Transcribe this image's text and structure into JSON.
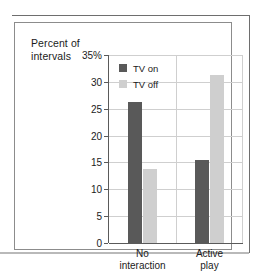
{
  "chart_data": {
    "type": "bar",
    "title": "",
    "subtitle": "",
    "ylabel": "Percent of intervals",
    "xlabel": "",
    "categories": [
      "No interaction",
      "Active play"
    ],
    "category_lines": [
      [
        "No",
        "interaction"
      ],
      [
        "Active",
        "play"
      ]
    ],
    "series": [
      {
        "name": "TV on",
        "color": "#595959",
        "values": [
          26.3,
          15.4
        ]
      },
      {
        "name": "TV off",
        "color": "#cfcfcf",
        "values": [
          13.7,
          31.2
        ]
      }
    ],
    "ylim": [
      0,
      35
    ],
    "yticks": [
      0,
      5,
      10,
      15,
      20,
      25,
      30,
      35
    ],
    "ytick_labels": [
      "0",
      "5",
      "10",
      "15",
      "20",
      "25",
      "30",
      "35%"
    ],
    "grid": true,
    "grid_axis": "y",
    "legend_position": "top-left-inside",
    "axis_colors": {
      "axis": "#5a5a5a",
      "grid": "#cfcfcf",
      "text": "#1b1b1b"
    }
  },
  "figure": {
    "axis_title_line1": "Percent of",
    "axis_title_line2": "intervals"
  }
}
